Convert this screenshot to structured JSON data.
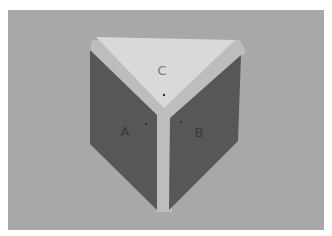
{
  "image": {
    "description": "Photograph of a three-faced block figure (corner of a cube / triangular prism) on a gray background",
    "colors": {
      "margin": "#ffffff",
      "background": "#a8a8a8",
      "top_face": "#d9d9d9",
      "side_faces": "#575757",
      "edge_highlight": "#bdbdbd"
    }
  },
  "faces": {
    "a": {
      "label": "A"
    },
    "b": {
      "label": "B"
    },
    "c": {
      "label": "C"
    }
  }
}
